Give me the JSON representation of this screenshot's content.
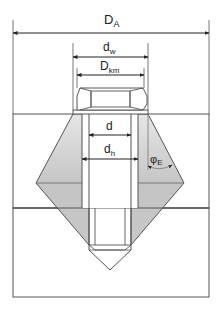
{
  "diagram": {
    "labels": {
      "D_A": {
        "main": "D",
        "sub": "A"
      },
      "d_w": {
        "main": "d",
        "sub": "w"
      },
      "D_km": {
        "main": "D",
        "sub": "km"
      },
      "d": {
        "main": "d",
        "sub": ""
      },
      "d_h": {
        "main": "d",
        "sub": "h"
      },
      "phi_E": {
        "main": "φ",
        "sub": "E"
      }
    },
    "colors": {
      "line": "#333333",
      "cone_fill": "#c8c8c8",
      "cone_fill_light": "#e4e4e4",
      "background": "#ffffff"
    }
  }
}
